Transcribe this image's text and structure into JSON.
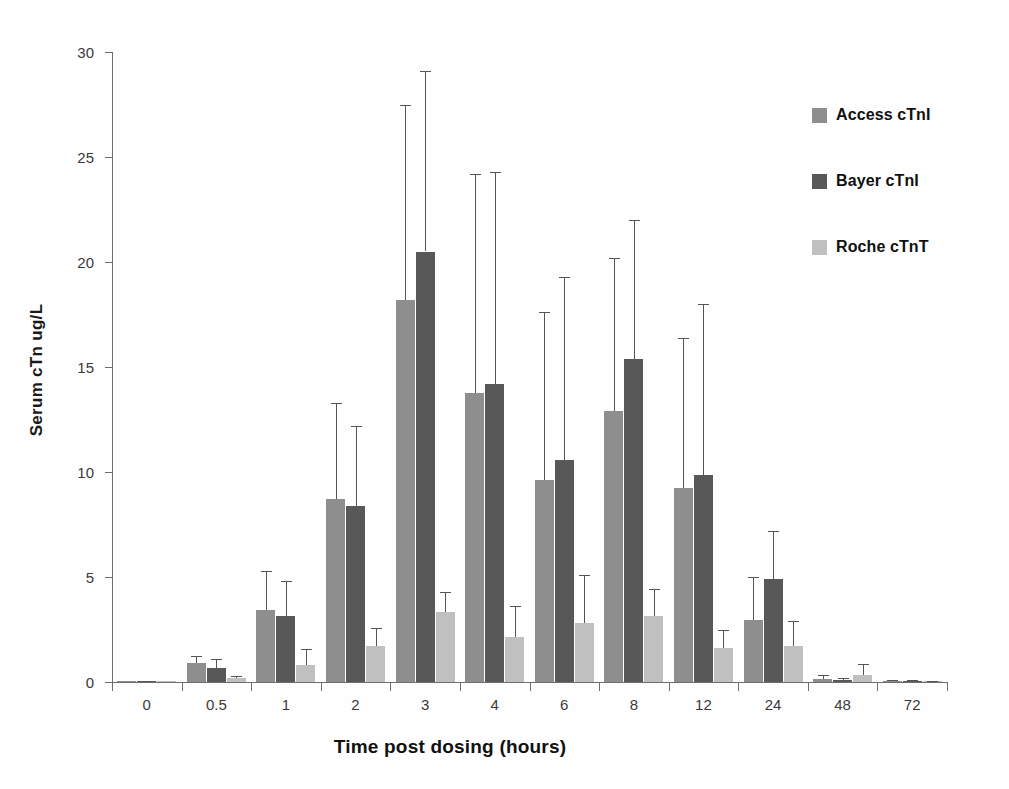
{
  "chart_data": {
    "type": "bar",
    "title": "",
    "xlabel": "Time post dosing (hours)",
    "ylabel": "Serum cTn ug/L",
    "categories": [
      "0",
      "0.5",
      "1",
      "2",
      "3",
      "4",
      "6",
      "8",
      "12",
      "24",
      "48",
      "72"
    ],
    "ylim": [
      0,
      30
    ],
    "yticks": [
      0,
      5,
      10,
      15,
      20,
      25,
      30
    ],
    "ytick_labels": [
      "0",
      "5",
      "10",
      "15",
      "20",
      "25",
      "30"
    ],
    "grid": false,
    "legend_position": "right",
    "error_bars": "upper only (SD)",
    "series": [
      {
        "name": "Access cTnI",
        "color": "#8e8e8e",
        "values": [
          0.05,
          0.9,
          3.45,
          8.7,
          18.2,
          13.75,
          9.6,
          12.9,
          9.25,
          2.95,
          0.15,
          0.05
        ],
        "errors_upper": [
          0.05,
          1.25,
          5.3,
          13.3,
          27.5,
          24.2,
          17.6,
          20.2,
          16.4,
          5.0,
          0.35,
          0.08
        ]
      },
      {
        "name": "Bayer cTnI",
        "color": "#585858",
        "values": [
          0.05,
          0.65,
          3.15,
          8.4,
          20.5,
          14.2,
          10.55,
          15.4,
          9.85,
          4.9,
          0.1,
          0.05
        ],
        "errors_upper": [
          0.05,
          1.1,
          4.8,
          12.2,
          29.1,
          24.3,
          19.3,
          22.0,
          18.0,
          7.2,
          0.2,
          0.08
        ]
      },
      {
        "name": "Roche cTnT",
        "color": "#c0c0c0",
        "values": [
          0.03,
          0.2,
          0.8,
          1.7,
          3.35,
          2.15,
          2.8,
          3.15,
          1.6,
          1.7,
          0.35,
          0.03
        ],
        "errors_upper": [
          0.03,
          0.3,
          1.55,
          2.55,
          4.3,
          3.6,
          5.1,
          4.45,
          2.5,
          2.9,
          0.85,
          0.05
        ]
      }
    ]
  },
  "legend": {
    "items": [
      {
        "label": "Access cTnI",
        "color": "#8e8e8e"
      },
      {
        "label": "Bayer cTnI",
        "color": "#585858"
      },
      {
        "label": "Roche cTnT",
        "color": "#c0c0c0"
      }
    ]
  }
}
